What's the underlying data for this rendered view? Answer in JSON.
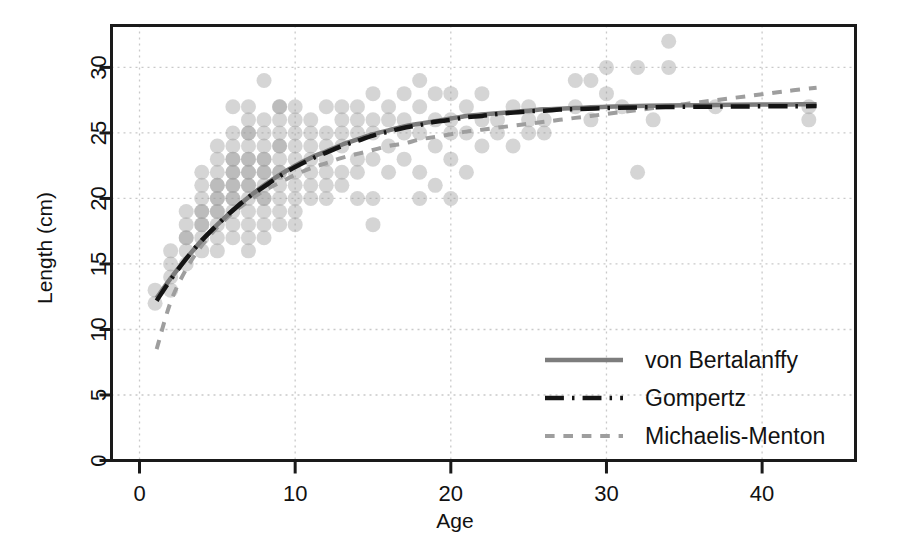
{
  "chart_data": {
    "type": "scatter",
    "title": "",
    "xlabel": "Age",
    "ylabel": "Length (cm)",
    "xlim": [
      -1.8,
      46
    ],
    "ylim": [
      0,
      33.2
    ],
    "xticks": [
      0,
      10,
      20,
      30,
      40
    ],
    "yticks": [
      0,
      5,
      10,
      15,
      20,
      25,
      30
    ],
    "xtick_labels": [
      "0",
      "10",
      "20",
      "30",
      "40"
    ],
    "ytick_labels": [
      "0",
      "5",
      "10",
      "15",
      "20",
      "25",
      "30"
    ],
    "grid": true,
    "grid_style": "dotted",
    "legend_position": "bottom-right",
    "point_color": "#9a9a9a",
    "point_opacity": 0.42,
    "point_radius": 7.5,
    "scatter": [
      [
        1,
        12
      ],
      [
        1,
        13
      ],
      [
        2,
        13
      ],
      [
        2,
        14
      ],
      [
        2,
        15
      ],
      [
        2,
        16
      ],
      [
        3,
        15
      ],
      [
        3,
        16
      ],
      [
        3,
        17
      ],
      [
        3,
        17
      ],
      [
        3,
        18
      ],
      [
        3,
        19
      ],
      [
        4,
        16
      ],
      [
        4,
        17
      ],
      [
        4,
        18
      ],
      [
        4,
        18
      ],
      [
        4,
        19
      ],
      [
        4,
        19
      ],
      [
        4,
        20
      ],
      [
        4,
        21
      ],
      [
        4,
        22
      ],
      [
        5,
        16
      ],
      [
        5,
        17
      ],
      [
        5,
        18
      ],
      [
        5,
        19
      ],
      [
        5,
        19
      ],
      [
        5,
        20
      ],
      [
        5,
        20
      ],
      [
        5,
        21
      ],
      [
        5,
        21
      ],
      [
        5,
        22
      ],
      [
        5,
        23
      ],
      [
        5,
        24
      ],
      [
        6,
        17
      ],
      [
        6,
        18
      ],
      [
        6,
        19
      ],
      [
        6,
        20
      ],
      [
        6,
        20
      ],
      [
        6,
        21
      ],
      [
        6,
        21
      ],
      [
        6,
        22
      ],
      [
        6,
        22
      ],
      [
        6,
        23
      ],
      [
        6,
        23
      ],
      [
        6,
        24
      ],
      [
        6,
        25
      ],
      [
        6,
        27
      ],
      [
        7,
        16
      ],
      [
        7,
        17
      ],
      [
        7,
        18
      ],
      [
        7,
        19
      ],
      [
        7,
        20
      ],
      [
        7,
        21
      ],
      [
        7,
        21
      ],
      [
        7,
        22
      ],
      [
        7,
        22
      ],
      [
        7,
        23
      ],
      [
        7,
        23
      ],
      [
        7,
        24
      ],
      [
        7,
        25
      ],
      [
        7,
        25
      ],
      [
        7,
        26
      ],
      [
        7,
        27
      ],
      [
        8,
        17
      ],
      [
        8,
        18
      ],
      [
        8,
        19
      ],
      [
        8,
        20
      ],
      [
        8,
        20
      ],
      [
        8,
        21
      ],
      [
        8,
        22
      ],
      [
        8,
        22
      ],
      [
        8,
        23
      ],
      [
        8,
        23
      ],
      [
        8,
        24
      ],
      [
        8,
        25
      ],
      [
        8,
        26
      ],
      [
        8,
        29
      ],
      [
        9,
        18
      ],
      [
        9,
        19
      ],
      [
        9,
        20
      ],
      [
        9,
        21
      ],
      [
        9,
        22
      ],
      [
        9,
        22
      ],
      [
        9,
        23
      ],
      [
        9,
        24
      ],
      [
        9,
        24
      ],
      [
        9,
        25
      ],
      [
        9,
        26
      ],
      [
        9,
        27
      ],
      [
        9,
        27
      ],
      [
        10,
        18
      ],
      [
        10,
        19
      ],
      [
        10,
        20
      ],
      [
        10,
        21
      ],
      [
        10,
        22
      ],
      [
        10,
        23
      ],
      [
        10,
        24
      ],
      [
        10,
        25
      ],
      [
        10,
        26
      ],
      [
        10,
        27
      ],
      [
        11,
        20
      ],
      [
        11,
        21
      ],
      [
        11,
        22
      ],
      [
        11,
        23
      ],
      [
        11,
        24
      ],
      [
        11,
        25
      ],
      [
        11,
        26
      ],
      [
        12,
        20
      ],
      [
        12,
        21
      ],
      [
        12,
        22
      ],
      [
        12,
        23
      ],
      [
        12,
        24
      ],
      [
        12,
        25
      ],
      [
        12,
        27
      ],
      [
        13,
        21
      ],
      [
        13,
        22
      ],
      [
        13,
        24
      ],
      [
        13,
        25
      ],
      [
        13,
        26
      ],
      [
        13,
        27
      ],
      [
        14,
        20
      ],
      [
        14,
        22
      ],
      [
        14,
        23
      ],
      [
        14,
        25
      ],
      [
        14,
        26
      ],
      [
        14,
        27
      ],
      [
        15,
        18
      ],
      [
        15,
        20
      ],
      [
        15,
        23
      ],
      [
        15,
        25
      ],
      [
        15,
        26
      ],
      [
        15,
        28
      ],
      [
        16,
        22
      ],
      [
        16,
        24
      ],
      [
        16,
        26
      ],
      [
        16,
        27
      ],
      [
        17,
        23
      ],
      [
        17,
        25
      ],
      [
        17,
        26
      ],
      [
        17,
        28
      ],
      [
        18,
        20
      ],
      [
        18,
        22
      ],
      [
        18,
        25
      ],
      [
        18,
        27
      ],
      [
        18,
        29
      ],
      [
        19,
        21
      ],
      [
        19,
        24
      ],
      [
        19,
        26
      ],
      [
        19,
        28
      ],
      [
        20,
        20
      ],
      [
        20,
        23
      ],
      [
        20,
        25
      ],
      [
        20,
        26
      ],
      [
        20,
        28
      ],
      [
        21,
        22
      ],
      [
        21,
        25
      ],
      [
        21,
        27
      ],
      [
        22,
        24
      ],
      [
        22,
        26
      ],
      [
        22,
        28
      ],
      [
        23,
        25
      ],
      [
        23,
        26
      ],
      [
        24,
        24
      ],
      [
        24,
        27
      ],
      [
        25,
        25
      ],
      [
        25,
        26
      ],
      [
        25,
        27
      ],
      [
        26,
        25
      ],
      [
        26,
        26
      ],
      [
        28,
        27
      ],
      [
        28,
        29
      ],
      [
        29,
        26
      ],
      [
        29,
        29
      ],
      [
        30,
        28
      ],
      [
        30,
        30
      ],
      [
        31,
        27
      ],
      [
        32,
        22
      ],
      [
        32,
        30
      ],
      [
        33,
        26
      ],
      [
        34,
        30
      ],
      [
        34,
        32
      ],
      [
        37,
        27
      ],
      [
        43,
        26
      ],
      [
        43,
        27
      ]
    ],
    "series": [
      {
        "name": "von Bertalanffy",
        "style": "solid",
        "color": "#7d7d7d",
        "width": 4.5,
        "Linf": 27.2,
        "K": 0.125,
        "t0": -4.6,
        "points": [
          [
            1.1,
            12.4
          ],
          [
            2,
            13.9
          ],
          [
            3,
            15.4
          ],
          [
            4,
            16.8
          ],
          [
            5,
            18.0
          ],
          [
            6,
            19.1
          ],
          [
            7,
            20.1
          ],
          [
            8,
            21.0
          ],
          [
            9,
            21.8
          ],
          [
            10,
            22.5
          ],
          [
            11,
            23.1
          ],
          [
            12,
            23.6
          ],
          [
            13,
            24.1
          ],
          [
            14,
            24.5
          ],
          [
            15,
            24.9
          ],
          [
            16,
            25.2
          ],
          [
            17,
            25.5
          ],
          [
            18,
            25.7
          ],
          [
            19,
            25.9
          ],
          [
            20,
            26.1
          ],
          [
            21,
            26.3
          ],
          [
            22,
            26.4
          ],
          [
            23,
            26.5
          ],
          [
            24,
            26.6
          ],
          [
            25,
            26.7
          ],
          [
            26,
            26.8
          ],
          [
            27,
            26.85
          ],
          [
            28,
            26.9
          ],
          [
            30,
            27.0
          ],
          [
            32,
            27.05
          ],
          [
            34,
            27.1
          ],
          [
            36,
            27.12
          ],
          [
            38,
            27.15
          ],
          [
            40,
            27.17
          ],
          [
            42,
            27.18
          ],
          [
            43.5,
            27.19
          ]
        ]
      },
      {
        "name": "Gompertz",
        "style": "dash-dot",
        "color": "#141414",
        "width": 4.5,
        "points": [
          [
            1.1,
            12.2
          ],
          [
            2,
            13.8
          ],
          [
            3,
            15.4
          ],
          [
            4,
            16.8
          ],
          [
            5,
            18.0
          ],
          [
            6,
            19.1
          ],
          [
            7,
            20.1
          ],
          [
            8,
            20.9
          ],
          [
            9,
            21.7
          ],
          [
            10,
            22.4
          ],
          [
            11,
            23.0
          ],
          [
            12,
            23.5
          ],
          [
            13,
            24.0
          ],
          [
            14,
            24.4
          ],
          [
            15,
            24.8
          ],
          [
            16,
            25.1
          ],
          [
            17,
            25.4
          ],
          [
            18,
            25.6
          ],
          [
            19,
            25.85
          ],
          [
            20,
            26.0
          ],
          [
            21,
            26.2
          ],
          [
            22,
            26.3
          ],
          [
            23,
            26.45
          ],
          [
            24,
            26.55
          ],
          [
            25,
            26.65
          ],
          [
            26,
            26.7
          ],
          [
            27,
            26.78
          ],
          [
            28,
            26.82
          ],
          [
            30,
            26.9
          ],
          [
            32,
            26.95
          ],
          [
            34,
            26.98
          ],
          [
            36,
            27.0
          ],
          [
            38,
            27.02
          ],
          [
            40,
            27.03
          ],
          [
            42,
            27.04
          ],
          [
            43.5,
            27.05
          ]
        ]
      },
      {
        "name": "Michaelis-Menton",
        "style": "dashed",
        "color": "#9e9e9e",
        "width": 4.0,
        "points": [
          [
            1.1,
            8.5
          ],
          [
            2,
            12.1
          ],
          [
            3,
            14.6
          ],
          [
            4,
            16.4
          ],
          [
            5,
            17.8
          ],
          [
            6,
            18.9
          ],
          [
            7,
            19.8
          ],
          [
            8,
            20.6
          ],
          [
            9,
            21.2
          ],
          [
            10,
            21.8
          ],
          [
            11,
            22.3
          ],
          [
            12,
            22.7
          ],
          [
            13,
            23.1
          ],
          [
            14,
            23.4
          ],
          [
            15,
            23.7
          ],
          [
            16,
            24.0
          ],
          [
            17,
            24.2
          ],
          [
            18,
            24.5
          ],
          [
            19,
            24.7
          ],
          [
            20,
            24.9
          ],
          [
            21,
            25.1
          ],
          [
            22,
            25.25
          ],
          [
            23,
            25.4
          ],
          [
            24,
            25.55
          ],
          [
            25,
            25.7
          ],
          [
            26,
            25.85
          ],
          [
            27,
            26.0
          ],
          [
            28,
            26.15
          ],
          [
            29,
            26.3
          ],
          [
            30,
            26.45
          ],
          [
            31,
            26.6
          ],
          [
            32,
            26.75
          ],
          [
            33,
            26.9
          ],
          [
            34,
            27.05
          ],
          [
            35,
            27.2
          ],
          [
            36,
            27.35
          ],
          [
            37,
            27.5
          ],
          [
            38,
            27.65
          ],
          [
            39,
            27.8
          ],
          [
            40,
            27.95
          ],
          [
            41,
            28.1
          ],
          [
            42,
            28.25
          ],
          [
            43.5,
            28.45
          ]
        ]
      }
    ],
    "legend": [
      {
        "label": "von Bertalanffy",
        "style": "solid",
        "color": "#7d7d7d"
      },
      {
        "label": "Gompertz",
        "style": "dash-dot",
        "color": "#141414"
      },
      {
        "label": "Michaelis-Menton",
        "style": "dashed",
        "color": "#9e9e9e"
      }
    ]
  }
}
